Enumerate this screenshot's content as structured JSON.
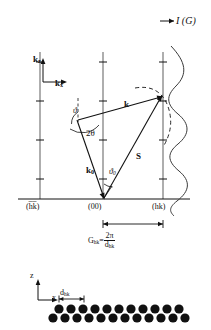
{
  "figure": {
    "title_label": "I (G)",
    "axes_upper": {
      "vertical": "k",
      "vertical_sub": "z",
      "horizontal": "k",
      "horizontal_sub": "x"
    },
    "axes_lower": {
      "vertical": "z",
      "horizontal": "x"
    },
    "vectors": [
      {
        "name": "k",
        "label": "k",
        "sub": ""
      },
      {
        "name": "k0",
        "label": "k",
        "sub": "0"
      },
      {
        "name": "S",
        "label": "S",
        "sub": ""
      }
    ],
    "angles": [
      {
        "name": "theta",
        "label": "ϑ",
        "sub": ""
      },
      {
        "name": "2theta",
        "label": "2θ",
        "sub": ""
      },
      {
        "name": "theta0",
        "label": "ϑ",
        "sub": "0"
      }
    ],
    "rods": [
      {
        "name": "rod-hkbar",
        "label": "(h̅k̅)"
      },
      {
        "name": "rod-00",
        "label": "(00)"
      },
      {
        "name": "rod-hk",
        "label": "(hk)"
      }
    ],
    "formula": {
      "lhs": "G",
      "lhs_sub": "hk",
      "equals": "=",
      "numerator": "2π",
      "denominator": "d",
      "denominator_sub": "hk"
    },
    "lattice": {
      "spacing_label": "d",
      "spacing_sub": "hk",
      "rows": 2,
      "atoms_per_row": 13
    },
    "colors": {
      "ink": "#111111",
      "rod": "#8c8c8c",
      "curve": "#3a3a3a"
    }
  }
}
